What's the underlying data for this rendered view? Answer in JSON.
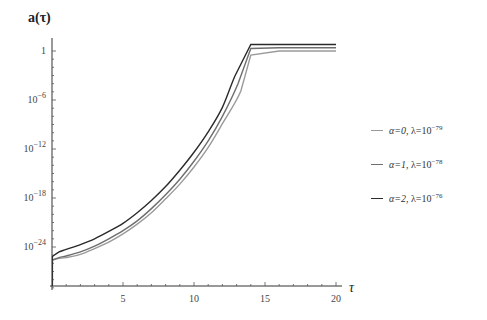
{
  "chart_data": {
    "type": "line",
    "title": "",
    "xlabel": "τ",
    "ylabel": "a(τ)",
    "yscale": "log",
    "xlim": [
      0,
      20
    ],
    "ylim_exponent": [
      -30,
      1
    ],
    "x_ticks": [
      5,
      10,
      15,
      20
    ],
    "x_tick_labels": [
      "5",
      "10",
      "15",
      "20"
    ],
    "y_ticks_exponent": [
      0,
      -6,
      -12,
      -18,
      -24
    ],
    "y_tick_labels": [
      "1",
      "10^-6",
      "10^-12",
      "10^-18",
      "10^-24"
    ],
    "grid": false,
    "legend_position": "right",
    "series": [
      {
        "name": "α=0, λ=10^-79",
        "alpha": 0,
        "lambda_exponent": -79,
        "color": "#9a9a9a",
        "x": [
          0,
          0.5,
          1,
          2,
          3,
          4,
          5,
          6,
          7,
          8,
          9,
          10,
          11,
          12,
          13.3,
          14,
          16,
          18,
          20
        ],
        "log10_y": [
          -25.6,
          -25.4,
          -25.3,
          -24.9,
          -24.2,
          -23.4,
          -22.4,
          -21.2,
          -19.8,
          -18.1,
          -16.3,
          -14.2,
          -11.8,
          -8.9,
          -4.9,
          -0.5,
          0.0,
          0.0,
          0.0
        ]
      },
      {
        "name": "α=1, λ=10^-78",
        "alpha": 1,
        "lambda_exponent": -78,
        "color": "#6e6e6e",
        "x": [
          0,
          0.5,
          1,
          2,
          3,
          4,
          5,
          6,
          7,
          8,
          9,
          10,
          11,
          12,
          13.1,
          14,
          16,
          18,
          20
        ],
        "log10_y": [
          -25.6,
          -25.3,
          -25.1,
          -24.6,
          -23.9,
          -23.0,
          -22.0,
          -20.8,
          -19.3,
          -17.6,
          -15.7,
          -13.5,
          -11.0,
          -8.0,
          -4.0,
          0.3,
          0.4,
          0.4,
          0.4
        ]
      },
      {
        "name": "α=2, λ=10^-76",
        "alpha": 2,
        "lambda_exponent": -76,
        "color": "#2a2a2a",
        "x": [
          0,
          0.5,
          1,
          2,
          3,
          4,
          5,
          6,
          7,
          8,
          9,
          10,
          11,
          12,
          12.9,
          14,
          16,
          18,
          20
        ],
        "log10_y": [
          -25.2,
          -24.6,
          -24.3,
          -23.7,
          -23.0,
          -22.1,
          -21.1,
          -19.8,
          -18.3,
          -16.6,
          -14.6,
          -12.4,
          -9.9,
          -6.9,
          -3.0,
          0.8,
          0.8,
          0.8,
          0.8
        ]
      }
    ]
  },
  "axes": {
    "y_title": "a(τ)",
    "x_title": "τ"
  },
  "legend": {
    "items": [
      {
        "alpha_label": "α=0, ",
        "lambda_label": "λ=10",
        "exp": "−79",
        "color": "#9a9a9a"
      },
      {
        "alpha_label": "α=1, ",
        "lambda_label": "λ=10",
        "exp": "−78",
        "color": "#6e6e6e"
      },
      {
        "alpha_label": "α=2, ",
        "lambda_label": "λ=10",
        "exp": "−76",
        "color": "#2a2a2a"
      }
    ]
  }
}
